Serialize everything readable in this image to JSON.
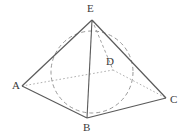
{
  "figure": {
    "background_color": "#ffffff",
    "stroke_color": "#5a5a5a",
    "hidden_stroke_color": "#8d8d8d",
    "label_color": "#3a3a3a",
    "vertices": {
      "A": {
        "label": "A",
        "x": 22,
        "y": 86,
        "label_x": 12,
        "label_y": 80
      },
      "B": {
        "label": "B",
        "x": 87,
        "y": 118,
        "label_x": 83,
        "label_y": 122
      },
      "C": {
        "label": "C",
        "x": 166,
        "y": 98,
        "label_x": 170,
        "label_y": 94
      },
      "D": {
        "label": "D",
        "x": 113,
        "y": 70,
        "label_x": 106,
        "label_y": 56
      },
      "E": {
        "label": "E",
        "x": 92,
        "y": 20,
        "label_x": 87,
        "label_y": 3
      }
    },
    "edges": [
      {
        "name": "edge-AB",
        "from": "A",
        "to": "B",
        "style": "solid"
      },
      {
        "name": "edge-BC",
        "from": "B",
        "to": "C",
        "style": "solid"
      },
      {
        "name": "edge-AE",
        "from": "A",
        "to": "E",
        "style": "solid"
      },
      {
        "name": "edge-CE",
        "from": "C",
        "to": "E",
        "style": "solid"
      },
      {
        "name": "edge-EB",
        "from": "E",
        "to": "B",
        "style": "solid"
      },
      {
        "name": "edge-AD",
        "from": "A",
        "to": "D",
        "style": "dotted"
      },
      {
        "name": "edge-DC",
        "from": "D",
        "to": "C",
        "style": "dotted"
      },
      {
        "name": "edge-ED",
        "from": "E",
        "to": "D",
        "style": "dashed"
      }
    ],
    "inscribed_sphere": {
      "name": "inscribed-sphere",
      "center_x": 92,
      "center_y": 72,
      "radius": 41,
      "style": "dashed"
    }
  }
}
